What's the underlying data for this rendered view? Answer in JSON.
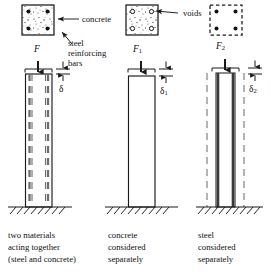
{
  "figure": {
    "background_color": "#ffffff",
    "line_color": "#1a1a1a",
    "fill_gray": "#b8b8b8",
    "fill_light": "#f2f2f2"
  },
  "annotations": {
    "concrete": "concrete",
    "steel_reinforcing_bars_line1": "steel",
    "steel_reinforcing_bars_line2": "reinforcing",
    "steel_reinforcing_bars_line3": "bars",
    "voids": "voids"
  },
  "panels": [
    {
      "id": "panel-composite",
      "cross_section": {
        "name": "cross-section-composite",
        "outline": "solid",
        "fill": "concrete-speckle",
        "corner_markers": "solid-dots",
        "marker_count": 4
      },
      "force_label": "F",
      "force_subscript": "",
      "deflection_label": "δ",
      "deflection_subscript": "",
      "column_style": "concrete-with-rebar",
      "caption_lines": [
        "two materials",
        "acting together",
        "(steel and concrete)"
      ]
    },
    {
      "id": "panel-concrete",
      "cross_section": {
        "name": "cross-section-concrete",
        "outline": "solid",
        "fill": "concrete-speckle",
        "corner_markers": "open-circles",
        "marker_count": 4
      },
      "force_label": "F",
      "force_subscript": "1",
      "deflection_label": "δ",
      "deflection_subscript": "1",
      "column_style": "concrete-plain",
      "caption_lines": [
        "concrete",
        "considered",
        "separately"
      ]
    },
    {
      "id": "panel-steel",
      "cross_section": {
        "name": "cross-section-steel",
        "outline": "dashed",
        "fill": "none",
        "corner_markers": "solid-dots",
        "marker_count": 4
      },
      "force_label": "F",
      "force_subscript": "2",
      "deflection_label": "δ",
      "deflection_subscript": "2",
      "column_style": "steel-bars-only",
      "caption_lines": [
        "steel",
        "considered",
        "separately"
      ]
    }
  ]
}
